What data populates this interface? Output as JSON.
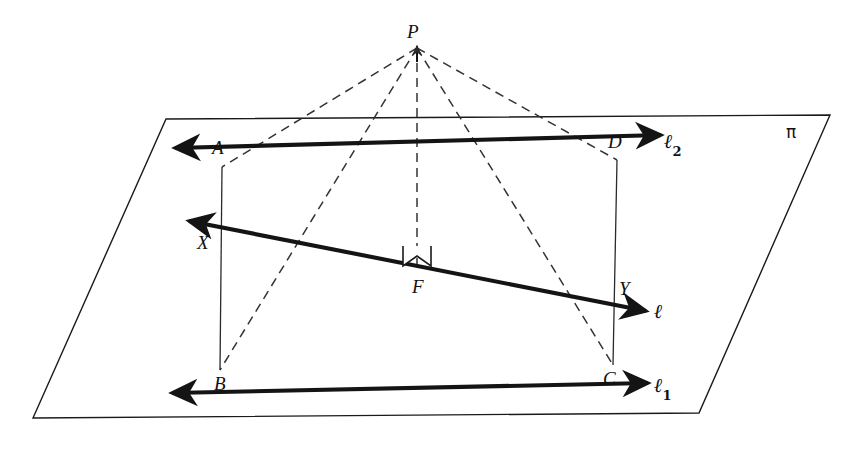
{
  "figure": {
    "plane": {
      "label": "π",
      "label_pos": [
        786,
        124
      ],
      "corners": [
        [
          166,
          119
        ],
        [
          830,
          115
        ],
        [
          699,
          413
        ],
        [
          33,
          418
        ]
      ],
      "stroke": "#1a1a1a",
      "stroke_width": 1.4
    },
    "points": [
      {
        "name": "P",
        "label": "P",
        "x": 417,
        "y": 48,
        "label_x": 407,
        "label_y": 22
      },
      {
        "name": "A",
        "label": "A",
        "x": 222,
        "y": 167,
        "label_x": 212,
        "label_y": 138
      },
      {
        "name": "B",
        "label": "B",
        "x": 220,
        "y": 370,
        "label_x": 214,
        "label_y": 374
      },
      {
        "name": "C",
        "label": "C",
        "x": 613,
        "y": 365,
        "label_x": 603,
        "label_y": 369
      },
      {
        "name": "D",
        "label": "D",
        "x": 617,
        "y": 160,
        "label_x": 608,
        "label_y": 132
      },
      {
        "name": "F",
        "label": "F",
        "x": 417,
        "y": 267,
        "label_x": 412,
        "label_y": 277
      },
      {
        "name": "X",
        "label": "X",
        "x": 220,
        "y": 227,
        "label_x": 197,
        "label_y": 233
      },
      {
        "name": "Y",
        "label": "Y",
        "x": 616,
        "y": 306,
        "label_x": 619,
        "label_y": 279
      }
    ],
    "lines": [
      {
        "name": "line-ell-1",
        "label": "ℓ",
        "sub": "1",
        "label_x": 654,
        "label_y": 375,
        "from": [
          172,
          393
        ],
        "to": [
          648,
          383
        ],
        "via": [
          222,
          167,
          417,
          267,
          613,
          365
        ],
        "style": "solid-bold",
        "arrows": "both"
      },
      {
        "name": "line-ell-2",
        "label": "ℓ",
        "sub": "2",
        "label_x": 664,
        "label_y": 131,
        "from": [
          175,
          148
        ],
        "to": [
          661,
          135
        ],
        "via": [
          220,
          370,
          417,
          267,
          617,
          160
        ],
        "style": "solid-bold",
        "arrows": "both"
      },
      {
        "name": "line-ell",
        "label": "ℓ",
        "sub": "",
        "label_x": 654,
        "label_y": 301,
        "from": [
          189,
          221
        ],
        "to": [
          646,
          311
        ],
        "via": [
          220,
          227,
          417,
          267,
          616,
          306
        ],
        "style": "solid-bold",
        "arrows": "both"
      }
    ],
    "segments": [
      {
        "name": "segment-ab",
        "from": [
          222,
          167
        ],
        "to": [
          220,
          370
        ],
        "style": "solid-thin"
      },
      {
        "name": "segment-cd",
        "from": [
          617,
          160
        ],
        "to": [
          613,
          365
        ],
        "style": "solid-thin"
      }
    ],
    "dashed_rays": [
      {
        "name": "dashed-pa",
        "from": [
          417,
          48
        ],
        "to": [
          222,
          167
        ]
      },
      {
        "name": "dashed-pb",
        "from": [
          417,
          48
        ],
        "to": [
          220,
          370
        ]
      },
      {
        "name": "dashed-pf",
        "from": [
          417,
          48
        ],
        "to": [
          417,
          267
        ]
      },
      {
        "name": "dashed-pc",
        "from": [
          417,
          48
        ],
        "to": [
          613,
          365
        ]
      },
      {
        "name": "dashed-pd",
        "from": [
          417,
          48
        ],
        "to": [
          617,
          160
        ]
      }
    ],
    "right_angle_marker": {
      "name": "right-angle-marker-at-f",
      "points": "403,246 403,266 417,256 431,266 431,246"
    },
    "colors": {
      "ink": "#141414",
      "paper": "#ffffff",
      "thin_stroke": "#2a2a2a"
    }
  }
}
